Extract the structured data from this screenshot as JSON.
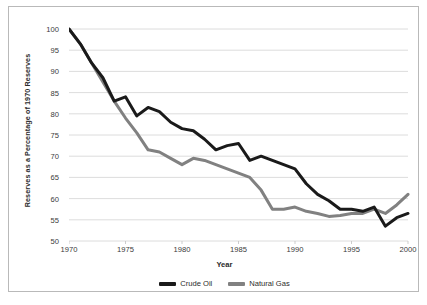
{
  "chart_data": {
    "type": "line",
    "title": "",
    "xlabel": "Year",
    "ylabel": "Reserves as a Percentage of 1970 Reserves",
    "xlim": [
      1970,
      2000
    ],
    "ylim": [
      50,
      100
    ],
    "xticks": [
      1970,
      1975,
      1980,
      1985,
      1990,
      1995,
      2000
    ],
    "yticks": [
      50,
      55,
      60,
      65,
      70,
      75,
      80,
      85,
      90,
      95,
      100
    ],
    "grid": "horizontal",
    "legend_position": "bottom-center",
    "x": [
      1970,
      1971,
      1972,
      1973,
      1974,
      1975,
      1976,
      1977,
      1978,
      1979,
      1980,
      1981,
      1982,
      1983,
      1984,
      1985,
      1986,
      1987,
      1988,
      1989,
      1990,
      1991,
      1992,
      1993,
      1994,
      1995,
      1996,
      1997,
      1998,
      1999,
      2000
    ],
    "series": [
      {
        "name": "Crude Oil",
        "color": "#1a1a1a",
        "values": [
          100.0,
          96.5,
          92.0,
          88.5,
          83.0,
          84.0,
          79.5,
          81.5,
          80.5,
          78.0,
          76.5,
          76.0,
          74.0,
          71.5,
          72.5,
          73.0,
          69.0,
          70.0,
          69.0,
          68.0,
          67.0,
          63.5,
          61.0,
          59.5,
          57.5,
          57.5,
          57.0,
          58.0,
          53.5,
          55.5,
          56.5
        ]
      },
      {
        "name": "Natural Gas",
        "color": "#818181",
        "values": [
          100.0,
          96.5,
          92.0,
          87.5,
          83.0,
          79.0,
          75.5,
          71.5,
          71.0,
          69.5,
          68.0,
          69.5,
          69.0,
          68.0,
          67.0,
          66.0,
          65.0,
          62.0,
          57.5,
          57.5,
          58.0,
          57.0,
          56.5,
          55.8,
          56.0,
          56.5,
          56.5,
          57.5,
          56.5,
          58.5,
          61.0
        ]
      }
    ]
  },
  "axes": {
    "ylabel_text": "Reserves as a Percentage of 1970 Reserves",
    "xlabel_text": "Year"
  },
  "legend": {
    "items": [
      {
        "label": "Crude Oil",
        "color": "#1a1a1a"
      },
      {
        "label": "Natural Gas",
        "color": "#818181"
      }
    ]
  }
}
